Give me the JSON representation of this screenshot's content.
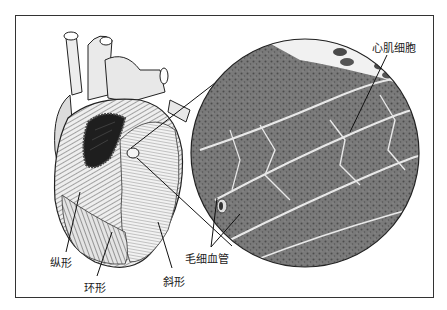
{
  "figure": {
    "labels": {
      "cardiomyocyte": "心肌细胞",
      "capillary": "毛细血管",
      "longitudinal": "纵形",
      "circular": "环形",
      "oblique": "斜形"
    }
  },
  "colors": {
    "border": "#333333",
    "tissue": "#7d7d7d",
    "tissue_dark": "#4a4a4a",
    "connective": "#e8e8e8",
    "heart_fill": "#e6e6e6",
    "line": "#111111"
  }
}
